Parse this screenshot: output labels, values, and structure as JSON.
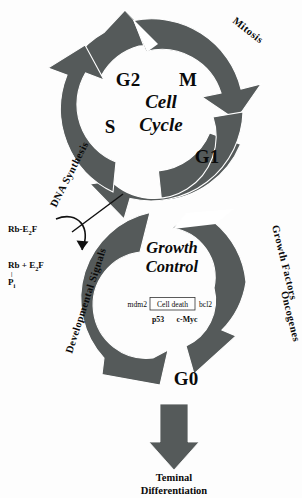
{
  "figure": {
    "background_color": "#fdfdfd",
    "arrow_color": "#555a5a",
    "text_color": "#0a0a0a"
  },
  "upper_cycle": {
    "center_title_line1": "Cell",
    "center_title_line2": "Cycle",
    "phases": [
      {
        "label": "G2",
        "position": "upper-left"
      },
      {
        "label": "M",
        "position": "upper-right"
      },
      {
        "label": "S",
        "position": "left"
      },
      {
        "label": "G1",
        "position": "lower-right"
      }
    ],
    "arc_labels": [
      {
        "label": "Mitosis",
        "position": "top-right-outside"
      },
      {
        "label": "DNA Synthesis",
        "position": "left-outside"
      }
    ]
  },
  "lower_cycle": {
    "center_title_line1": "Growth",
    "center_title_line2": "Control",
    "phase_label": "G0",
    "arc_labels": [
      {
        "label": "Growth Factors",
        "position": "right-upper-outside"
      },
      {
        "label": "Oncogenes",
        "position": "right-lower-outside"
      },
      {
        "label": "Developmental Signals",
        "position": "left-outside"
      }
    ],
    "gene_row": {
      "left_gene": "mdm2",
      "boxed_text": "Cell death",
      "right_gene": "bcl2"
    },
    "gene_row_below": {
      "left_gene": "p53",
      "right_gene": "c-Myc"
    }
  },
  "restriction_annotation": {
    "complex_main": "Rb-E",
    "complex_sub": "2",
    "complex_tail": "F",
    "product_line_left": "Rb + E",
    "product_line_sub": "2",
    "product_line_tail": "F",
    "phosphate_bond": "|",
    "phosphate_label": "P",
    "phosphate_sub": "i"
  },
  "outcome": {
    "arrow_direction": "down",
    "line1": "Teminal",
    "line2": "Differentiation"
  }
}
